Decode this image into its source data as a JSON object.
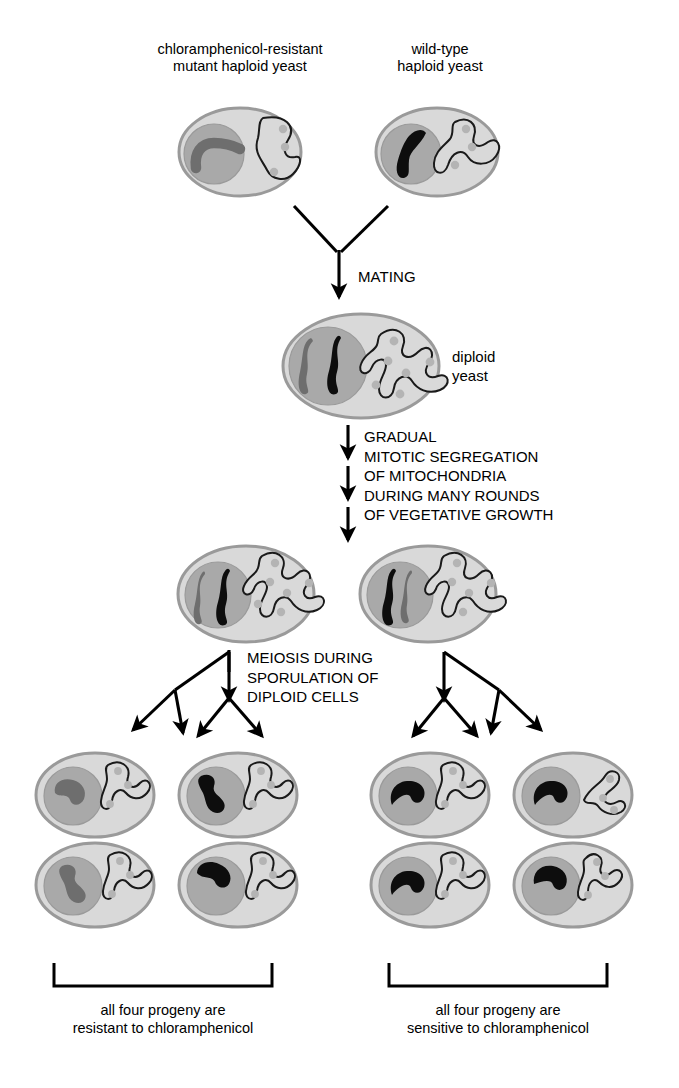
{
  "figure": {
    "background_color": "#ffffff",
    "ink_color": "#000000"
  },
  "palette": {
    "cell_fill": "#d9d9d9",
    "cell_stroke": "#9a9a9a",
    "nucleus_fill": "#a9a9a9",
    "nucleus_stroke": "#9a9a9a",
    "dna_gray": "#6e6e6e",
    "dna_black": "#0d0d0d",
    "mito_stroke": "#1a1a1a",
    "mito_fill": "#d9d9d9",
    "nucleoid": "#b4b4b4",
    "arrow": "#000000"
  },
  "top_labels": {
    "left": "chloramphenicol-resistant\nmutant haploid yeast",
    "right": "wild-type\nhaploid yeast"
  },
  "steps": {
    "mating": "MATING",
    "segregation": "GRADUAL\nMITOTIC SEGREGATION\nOF MITOCHONDRIA\nDURING MANY ROUNDS\nOF VEGETATIVE GROWTH",
    "meiosis": "MEIOSIS DURING\nSPORULATION OF\nDIPLOID CELLS"
  },
  "diploid_label": "diploid\nyeast",
  "captions": {
    "left": "all four progeny are\nresistant to chloramphenicol",
    "right": "all four progeny are\nsensitive to chloramphenicol"
  },
  "cells": {
    "parent_left": {
      "name": "chloramphenicol-resistant mutant haploid yeast",
      "nuclear_dna": [
        "gray"
      ],
      "mitochondria_type": "mutant",
      "nucleoid_count": 3
    },
    "parent_right": {
      "name": "wild-type haploid yeast",
      "nuclear_dna": [
        "black"
      ],
      "mitochondria_type": "wild-type",
      "nucleoid_count": 3
    },
    "diploid": {
      "name": "diploid yeast",
      "nuclear_dna": [
        "gray",
        "black"
      ],
      "mitochondria_type": "mixed",
      "nucleoid_count": 6
    },
    "segregated_left": {
      "name": "segregated diploid, resistant mitochondria",
      "nuclear_dna": [
        "gray",
        "black"
      ],
      "mitochondria_type": "mutant",
      "nucleoid_count": 6
    },
    "segregated_right": {
      "name": "segregated diploid, sensitive mitochondria",
      "nuclear_dna": [
        "gray",
        "black"
      ],
      "mitochondria_type": "wild-type",
      "nucleoid_count": 5
    },
    "progeny_left": [
      {
        "nuclear_dna": "gray",
        "mito": "mutant"
      },
      {
        "nuclear_dna": "black",
        "mito": "mutant"
      },
      {
        "nuclear_dna": "gray",
        "mito": "mutant"
      },
      {
        "nuclear_dna": "black",
        "mito": "mutant"
      }
    ],
    "progeny_right": [
      {
        "nuclear_dna": "black",
        "mito": "wild-type"
      },
      {
        "nuclear_dna": "black",
        "mito": "wild-type"
      },
      {
        "nuclear_dna": "black",
        "mito": "wild-type"
      },
      {
        "nuclear_dna": "black",
        "mito": "wild-type"
      }
    ]
  },
  "counts": {
    "progeny_per_tetrad": 4,
    "tetrads": 2,
    "segregation_arrows": 3
  }
}
